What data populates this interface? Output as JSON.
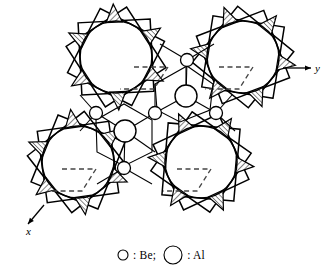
{
  "figure": {
    "background": "#ffffff",
    "line_color": "#000000",
    "hatch_color": "#555555",
    "dashed_color": "#444444",
    "width": 321,
    "height": 272
  },
  "axes": {
    "y_axis": {
      "label": "y",
      "direction": "right",
      "x1": 283,
      "y1": 68,
      "x2": 311,
      "y2": 68
    },
    "x_axis": {
      "label": "x",
      "direction": "down-left",
      "x1": 44,
      "y1": 205,
      "x2": 28,
      "y2": 224
    }
  },
  "legend": {
    "be": {
      "symbol": "circle-small",
      "text": ": Be;",
      "radius": 5.5
    },
    "al": {
      "symbol": "circle-large",
      "text": ": Al",
      "radius": 9.5
    }
  },
  "clusters": [
    {
      "name": "cluster-top-left",
      "cx": 116,
      "cy": 57,
      "r_circle": 36,
      "r_star": 51,
      "rotation": 12,
      "cell": {
        "ox": 18,
        "oy": 10,
        "ax": 34,
        "ay": 0,
        "bx": -14,
        "by": 22
      }
    },
    {
      "name": "cluster-top-right",
      "cx": 243,
      "cy": 57,
      "r_circle": 36,
      "r_star": 51,
      "rotation": -6,
      "cell": {
        "ox": -24,
        "oy": 10,
        "ax": 34,
        "ay": 0,
        "bx": -14,
        "by": 22
      }
    },
    {
      "name": "cluster-bottom-left",
      "cx": 78,
      "cy": 162,
      "r_circle": 36,
      "r_star": 51,
      "rotation": 7,
      "cell": {
        "ox": -16,
        "oy": 7,
        "ax": 34,
        "ay": 0,
        "bx": -14,
        "by": 22
      }
    },
    {
      "name": "cluster-bottom-right",
      "cx": 201,
      "cy": 162,
      "r_circle": 36,
      "r_star": 51,
      "rotation": -10,
      "cell": {
        "ox": -24,
        "oy": 7,
        "ax": 34,
        "ay": 0,
        "bx": -14,
        "by": 22
      }
    }
  ],
  "atoms": {
    "al_medium": [
      {
        "name": "al-center-upper",
        "cx": 186,
        "cy": 96,
        "r": 11
      },
      {
        "name": "al-center-lower",
        "cx": 125,
        "cy": 131,
        "r": 11
      }
    ],
    "be_small": [
      {
        "name": "be-top-center",
        "cx": 187,
        "cy": 60,
        "r": 6.5
      },
      {
        "name": "be-mid-left",
        "cx": 96,
        "cy": 113,
        "r": 6.5
      },
      {
        "name": "be-mid-center",
        "cx": 155,
        "cy": 113,
        "r": 6.5
      },
      {
        "name": "be-mid-right",
        "cx": 216,
        "cy": 113,
        "r": 6.5
      },
      {
        "name": "be-bottom-center",
        "cx": 124,
        "cy": 168,
        "r": 6.5
      }
    ]
  },
  "network_bonds": [
    [
      187,
      60,
      186,
      96
    ],
    [
      186,
      96,
      216,
      113
    ],
    [
      186,
      96,
      155,
      113
    ],
    [
      155,
      113,
      125,
      131
    ],
    [
      216,
      113,
      235,
      131
    ],
    [
      125,
      131,
      96,
      113
    ],
    [
      125,
      131,
      124,
      168
    ],
    [
      125,
      131,
      155,
      152
    ],
    [
      96,
      113,
      80,
      95
    ],
    [
      187,
      60,
      160,
      44
    ],
    [
      187,
      60,
      214,
      44
    ],
    [
      124,
      168,
      97,
      184
    ],
    [
      124,
      168,
      152,
      184
    ],
    [
      216,
      113,
      232,
      95
    ],
    [
      96,
      113,
      80,
      131
    ],
    [
      155,
      113,
      155,
      84
    ],
    [
      186,
      96,
      186,
      60
    ]
  ],
  "center_polygon_rings": [
    {
      "name": "ring-upper",
      "points": "155,84 187,66 213,84 210,110 180,122 157,110"
    },
    {
      "name": "ring-lower",
      "points": "96,120 124,104 152,120 152,152 124,166 97,152"
    }
  ],
  "star": {
    "points": 12,
    "spike_ratio": 1.42,
    "hatched_indices": [
      0,
      2,
      4,
      6,
      8,
      10
    ]
  }
}
